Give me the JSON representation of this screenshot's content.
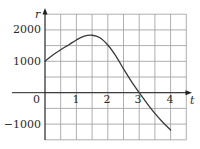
{
  "chart_data": {
    "type": "line",
    "title": "",
    "xlabel": "t",
    "ylabel": "r",
    "xlim": [
      0,
      4.5
    ],
    "ylim": [
      -1500,
      2500
    ],
    "grid": true,
    "grid_step_x": 0.5,
    "grid_step_y": 500,
    "x_ticks": [
      "0",
      "1",
      "2",
      "3",
      "4"
    ],
    "y_ticks": [
      "2000",
      "1000",
      "0",
      "-1000"
    ],
    "series": [
      {
        "name": "r(t)",
        "x": [
          0,
          0.25,
          0.5,
          0.75,
          1.0,
          1.25,
          1.5,
          1.75,
          2.0,
          2.25,
          2.5,
          2.75,
          3.0,
          3.25,
          3.5,
          3.75,
          4.0
        ],
        "values": [
          1000,
          1200,
          1370,
          1520,
          1680,
          1800,
          1830,
          1750,
          1520,
          1180,
          760,
          360,
          0,
          -340,
          -660,
          -940,
          -1190
        ]
      }
    ]
  },
  "labels": {
    "y_axis": "r",
    "x_axis": "t",
    "y2000": "2000",
    "y1000": "1000",
    "y0": "0",
    "yneg1000": "−1000",
    "x1": "1",
    "x2": "2",
    "x3": "3",
    "x4": "4"
  },
  "colors": {
    "grid": "#9a9a9a",
    "axis": "#222222",
    "curve": "#3a3a3a",
    "text": "#2a2a2a"
  }
}
